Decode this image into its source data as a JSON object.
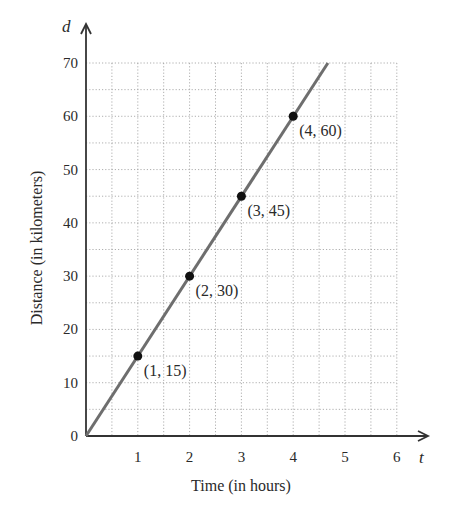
{
  "chart_data": {
    "type": "line",
    "title": "",
    "xlabel": "Time (in hours)",
    "ylabel": "Distance (in kilometers)",
    "x_axis_var": "t",
    "y_axis_var": "d",
    "x_ticks": [
      "1",
      "2",
      "3",
      "4",
      "5",
      "6"
    ],
    "y_ticks": [
      "0",
      "10",
      "20",
      "30",
      "40",
      "50",
      "60",
      "70"
    ],
    "xlim": [
      0,
      6
    ],
    "ylim": [
      0,
      70
    ],
    "grid": true,
    "grid_x_step": 0.5,
    "grid_y_step": 5,
    "line": {
      "equation": "d = 15t",
      "x": [
        0,
        4.67
      ],
      "y": [
        0,
        70
      ]
    },
    "series": [
      {
        "name": "points",
        "x": [
          1,
          2,
          3,
          4
        ],
        "y": [
          15,
          30,
          45,
          60
        ]
      }
    ],
    "annotations": [
      "(1, 15)",
      "(2, 30)",
      "(3, 45)",
      "(4, 60)"
    ],
    "colors": {
      "line": "#6e6e6e",
      "points": "#111111",
      "axis": "#333333",
      "grid": "#9a9a9a"
    }
  }
}
